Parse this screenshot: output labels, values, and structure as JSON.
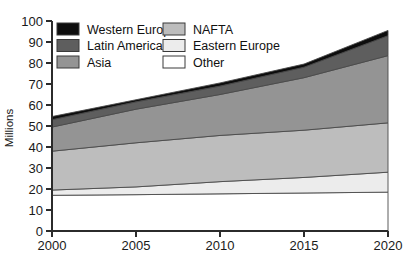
{
  "chart_data": {
    "type": "area",
    "stacked": true,
    "title": "",
    "xlabel": "",
    "ylabel": "Millions",
    "x": [
      2000,
      2005,
      2010,
      2015,
      2020
    ],
    "xtick_labels": [
      "2000",
      "2005",
      "2010",
      "2015",
      "2020"
    ],
    "xlim": [
      2000,
      2020
    ],
    "ylim": [
      0,
      100
    ],
    "ytick_labels": [
      "0",
      "10",
      "20",
      "30",
      "40",
      "50",
      "60",
      "70",
      "80",
      "90",
      "100"
    ],
    "yticks": [
      0,
      10,
      20,
      30,
      40,
      50,
      60,
      70,
      80,
      90,
      100
    ],
    "grid": false,
    "legend_position": "top-left-inside",
    "stack_order_bottom_to_top": [
      "Other",
      "Eastern Europe",
      "NAFTA",
      "Asia",
      "Latin America",
      "Western Europe"
    ],
    "series": [
      {
        "name": "Other",
        "color": "#ffffff",
        "values": [
          17.0,
          17.3,
          17.7,
          18.1,
          18.5
        ],
        "cumulative_top": [
          17.0,
          17.3,
          17.7,
          18.1,
          18.5
        ]
      },
      {
        "name": "Eastern Europe",
        "color": "#ececec",
        "values": [
          2.5,
          3.7,
          5.8,
          7.4,
          9.5
        ],
        "cumulative_top": [
          19.5,
          21.0,
          23.5,
          25.5,
          28.0
        ]
      },
      {
        "name": "NAFTA",
        "color": "#bdbdbd",
        "values": [
          18.5,
          21.0,
          22.0,
          22.5,
          23.5
        ],
        "cumulative_top": [
          38.0,
          42.0,
          45.5,
          48.0,
          51.5
        ]
      },
      {
        "name": "Asia",
        "color": "#949494",
        "values": [
          11.5,
          16.0,
          19.5,
          25.0,
          32.0
        ],
        "cumulative_top": [
          49.5,
          58.0,
          65.0,
          73.0,
          83.5
        ]
      },
      {
        "name": "Latin America",
        "color": "#5e5e5e",
        "values": [
          3.5,
          3.5,
          4.0,
          5.0,
          9.5
        ],
        "cumulative_top": [
          53.0,
          61.5,
          69.0,
          78.0,
          93.0
        ]
      },
      {
        "name": "Western Europe",
        "color": "#0d0d0d",
        "values": [
          1.5,
          1.0,
          1.5,
          1.5,
          2.5
        ],
        "cumulative_top": [
          54.5,
          62.5,
          70.5,
          79.5,
          95.5
        ]
      }
    ],
    "legend_entries": [
      {
        "label": "Western Europe",
        "color": "#0d0d0d",
        "column": 0,
        "row": 0
      },
      {
        "label": "Latin America",
        "color": "#5e5e5e",
        "column": 0,
        "row": 1
      },
      {
        "label": "Asia",
        "color": "#949494",
        "column": 0,
        "row": 2
      },
      {
        "label": "NAFTA",
        "color": "#bdbdbd",
        "column": 1,
        "row": 0
      },
      {
        "label": "Eastern Europe",
        "color": "#ececec",
        "column": 1,
        "row": 1
      },
      {
        "label": "Other",
        "color": "#ffffff",
        "column": 1,
        "row": 2
      }
    ]
  }
}
